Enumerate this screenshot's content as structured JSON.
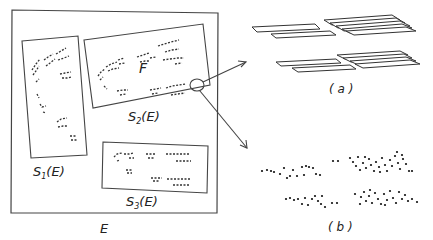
{
  "figure": {
    "type": "self-similar set diagram",
    "labels": {
      "outer_set": "E",
      "fractal": "F",
      "map1": "S",
      "map1_sub": "1",
      "map1_arg": "(E)",
      "map2": "S",
      "map2_sub": "2",
      "map2_arg": "(E)",
      "map3": "S",
      "map3_sub": "3",
      "map3_arg": "(E)",
      "panel_a": "( a )",
      "panel_b": "( b )"
    },
    "colors": {
      "stroke": "#444444",
      "background": "#ffffff",
      "dots": "#111111"
    }
  }
}
